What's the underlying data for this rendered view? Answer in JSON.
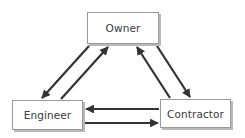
{
  "diagram": {
    "nodes": {
      "owner": {
        "label": "Owner"
      },
      "engineer": {
        "label": "Engineer"
      },
      "contractor": {
        "label": "Contractor"
      }
    },
    "edges": [
      {
        "from": "Owner",
        "to": "Engineer"
      },
      {
        "from": "Engineer",
        "to": "Owner"
      },
      {
        "from": "Contractor",
        "to": "Owner"
      },
      {
        "from": "Owner",
        "to": "Contractor"
      },
      {
        "from": "Contractor",
        "to": "Engineer"
      },
      {
        "from": "Engineer",
        "to": "Contractor"
      }
    ],
    "colors": {
      "arrow": "#333333",
      "box_border": "#9a9a9a",
      "box_shadow": "#b8b8b8",
      "text": "#3a3a3a"
    }
  }
}
